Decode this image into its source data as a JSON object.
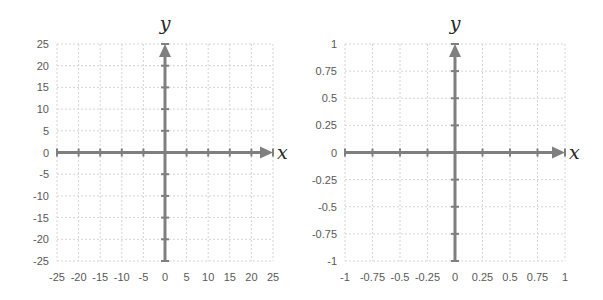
{
  "chart_data": [
    {
      "type": "scatter",
      "title": "",
      "xlabel": "x",
      "ylabel": "y",
      "xlim": [
        -25,
        25
      ],
      "ylim": [
        -25,
        25
      ],
      "x_ticks": [
        -25,
        -20,
        -15,
        -10,
        -5,
        0,
        5,
        10,
        15,
        20,
        25
      ],
      "y_ticks": [
        -25,
        -20,
        -15,
        -10,
        -5,
        0,
        5,
        10,
        15,
        20,
        25
      ],
      "x_tick_labels": [
        "-25",
        "-20",
        "-15",
        "-10",
        "-5",
        "0",
        "5",
        "10",
        "15",
        "20",
        "25"
      ],
      "y_tick_labels": [
        "-25",
        "-20",
        "-15",
        "-10",
        "-5",
        "0",
        "5",
        "10",
        "15",
        "20",
        "25"
      ],
      "grid": true,
      "series": [],
      "axis_color": "#7f7f7f",
      "grid_color": "#d4d4d4"
    },
    {
      "type": "scatter",
      "title": "",
      "xlabel": "x",
      "ylabel": "y",
      "xlim": [
        -1,
        1
      ],
      "ylim": [
        -1,
        1
      ],
      "x_ticks": [
        -1,
        -0.75,
        -0.5,
        -0.25,
        0,
        0.25,
        0.5,
        0.75,
        1
      ],
      "y_ticks": [
        -1,
        -0.75,
        -0.5,
        -0.25,
        0,
        0.25,
        0.5,
        0.75,
        1
      ],
      "x_tick_labels": [
        "-1",
        "-0.75",
        "-0.5",
        "-0.25",
        "0",
        "0.25",
        "0.5",
        "0.75",
        "1"
      ],
      "y_tick_labels": [
        "-1",
        "-0.75",
        "-0.5",
        "-0.25",
        "0",
        "0.25",
        "0.5",
        "0.75",
        "1"
      ],
      "grid": true,
      "series": [],
      "axis_color": "#7f7f7f",
      "grid_color": "#d4d4d4"
    }
  ]
}
